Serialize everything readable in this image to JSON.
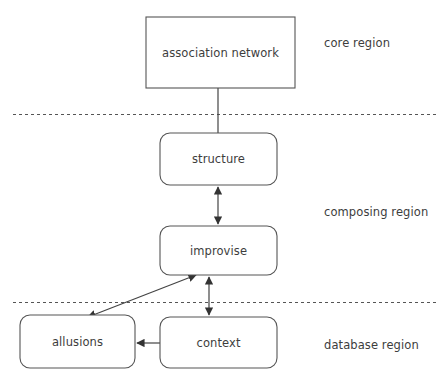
{
  "diagram": {
    "canvas": {
      "width": 438,
      "height": 386,
      "background": "#ffffff"
    },
    "stroke_color": "#555555",
    "text_color": "#3d3d3d",
    "nodes": [
      {
        "id": "association-network",
        "label": "association network",
        "shape": "rectangle",
        "x": 146,
        "y": 17,
        "w": 149,
        "h": 71,
        "region": "core region"
      },
      {
        "id": "structure",
        "label": "structure",
        "shape": "rounded-rectangle",
        "x": 160,
        "y": 133,
        "w": 117,
        "h": 52,
        "region": "composing region"
      },
      {
        "id": "improvise",
        "label": "improvise",
        "shape": "rounded-rectangle",
        "x": 160,
        "y": 226,
        "w": 117,
        "h": 49,
        "region": "composing region"
      },
      {
        "id": "allusions",
        "label": "allusions",
        "shape": "rounded-rectangle",
        "x": 20,
        "y": 315,
        "w": 115,
        "h": 53,
        "region": "database region"
      },
      {
        "id": "context",
        "label": "context",
        "shape": "rounded-rectangle",
        "x": 160,
        "y": 317,
        "w": 117,
        "h": 51,
        "region": "database region"
      }
    ],
    "regions": [
      {
        "id": "core",
        "label": "core region",
        "label_x": 324,
        "label_y": 36
      },
      {
        "id": "composing",
        "label": "composing region",
        "label_x": 324,
        "label_y": 205
      },
      {
        "id": "database",
        "label": "database region",
        "label_x": 324,
        "label_y": 338
      }
    ],
    "dividers": [
      {
        "id": "core-composing-divider",
        "y": 114,
        "x1": 13,
        "x2": 438
      },
      {
        "id": "composing-database-divider",
        "y": 302,
        "x1": 13,
        "x2": 438
      }
    ],
    "connectors": [
      {
        "id": "association-network-to-structure",
        "from": "association-network",
        "to": "structure",
        "arrow": "none",
        "path": "M 218 88 L 218 133"
      },
      {
        "id": "structure-improvise-link",
        "from": "structure",
        "to": "improvise",
        "arrow": "both",
        "path": "M 218 226 L 218 185"
      },
      {
        "id": "improvise-context-link",
        "from": "improvise",
        "to": "context",
        "arrow": "both",
        "path": "M 209 317 L 209 275"
      },
      {
        "id": "improvise-allusions-link",
        "from": "improvise",
        "to": "allusions",
        "arrow": "both",
        "path": "M 86 318 L 198 274"
      },
      {
        "id": "context-to-allusions",
        "from": "context",
        "to": "allusions",
        "arrow": "single",
        "path": "M 160 343 L 135 343"
      }
    ]
  }
}
